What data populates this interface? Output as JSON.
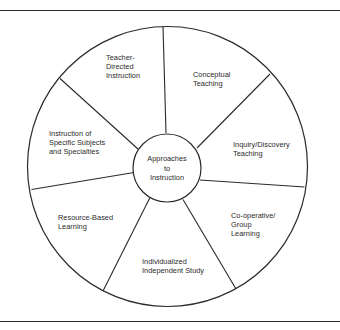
{
  "diagram": {
    "type": "radial-segmented-wheel",
    "center": {
      "lines": [
        "Approaches",
        "to",
        "Instruction"
      ]
    },
    "segments": [
      {
        "id": "teacher-directed",
        "lines": [
          "Teacher-",
          "Directed",
          "Instruction"
        ]
      },
      {
        "id": "conceptual",
        "lines": [
          "Conceptual",
          "Teaching"
        ]
      },
      {
        "id": "inquiry-discovery",
        "lines": [
          "Inquiry/Discovery",
          "Teaching"
        ]
      },
      {
        "id": "cooperative-group",
        "lines": [
          "Co-operative/",
          "Group",
          "Learning"
        ]
      },
      {
        "id": "individualized",
        "lines": [
          "Individualized",
          "Independent Study"
        ]
      },
      {
        "id": "resource-based",
        "lines": [
          "Resource-Based",
          "Learning"
        ]
      },
      {
        "id": "specific-subjects",
        "lines": [
          "Instruction of",
          "Specific Subjects",
          "and Specialties"
        ]
      }
    ],
    "colors": {
      "stroke": "#2a2a2a",
      "text": "#2b2b2b",
      "background": "#ffffff"
    }
  }
}
